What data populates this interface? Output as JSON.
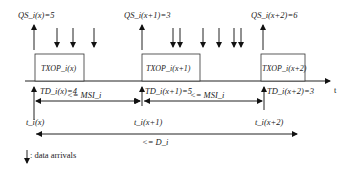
{
  "diagram": {
    "axis_label": "t",
    "qs_labels": [
      "QS_i(x)=5",
      "QS_i(x+1)=3",
      "QS_i(x+2)=6"
    ],
    "txop_labels": [
      "TXOP_i(x)",
      "TXOP_i(x+1)",
      "TXOP_i(x+2)"
    ],
    "td_labels": [
      "TD_i(x)=4",
      "TD_i(x+1)=5",
      "TD_i(x+2)=3"
    ],
    "time_labels": [
      "t_i(x)",
      "t_i(x+1)",
      "t_i(x+2)"
    ],
    "msi_labels": [
      "<= MSI_i",
      "<= MSI_i"
    ],
    "d_label": "<= D_i",
    "legend": {
      "icon": "down-arrow-icon",
      "text": ": data arrivals"
    },
    "data_arrival_counts": [
      3,
      6
    ]
  }
}
